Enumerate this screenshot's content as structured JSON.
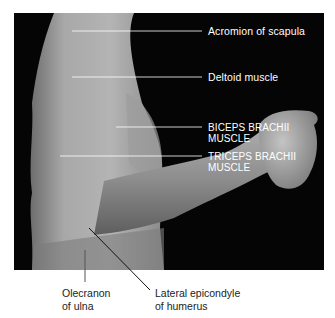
{
  "figure": {
    "labels_on_photo": [
      {
        "id": "acromion",
        "text": "Acromion of scapula"
      },
      {
        "id": "deltoid",
        "text": "Deltoid muscle"
      },
      {
        "id": "biceps",
        "line1": "BICEPS BRACHII",
        "line2": "MUSCLE"
      },
      {
        "id": "triceps",
        "line1": "TRICEPS BRACHII",
        "line2": "MUSCLE"
      }
    ],
    "captions_below": [
      {
        "id": "olecranon",
        "line1": "Olecranon",
        "line2": "of ulna"
      },
      {
        "id": "lateral-epicondyle",
        "line1": "Lateral epicondyle",
        "line2": "of humerus"
      }
    ],
    "colors": {
      "background": "#050505",
      "skin_light": "#b8b8b8",
      "skin_mid": "#8c8c8c",
      "skin_dark": "#5a5a5a",
      "label_text": "#ffffff",
      "caption_text": "#222222"
    }
  }
}
